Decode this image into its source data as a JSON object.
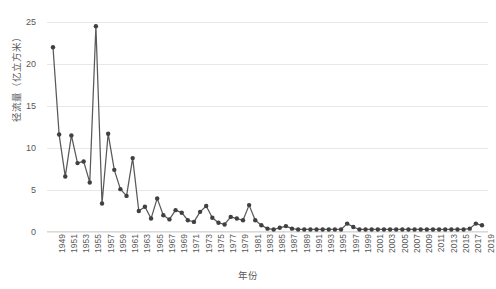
{
  "chart_data": {
    "type": "line",
    "title": "",
    "xlabel": "年份",
    "ylabel": "径流量（亿立方米）",
    "xlim": [
      1949,
      2019
    ],
    "ylim": [
      0,
      25
    ],
    "yticks": [
      0,
      5,
      10,
      15,
      20,
      25
    ],
    "xticks": [
      1949,
      1951,
      1953,
      1955,
      1957,
      1959,
      1961,
      1963,
      1965,
      1967,
      1969,
      1971,
      1973,
      1975,
      1977,
      1979,
      1981,
      1983,
      1985,
      1987,
      1989,
      1991,
      1993,
      1995,
      1997,
      1999,
      2001,
      2003,
      2005,
      2007,
      2009,
      2011,
      2013,
      2015,
      2017,
      2019
    ],
    "grid": true,
    "legend": false,
    "marker": "circle",
    "line_color": "#595959",
    "marker_color": "#404040",
    "grid_color": "#e8e8e8",
    "x": [
      1949,
      1950,
      1951,
      1952,
      1953,
      1954,
      1955,
      1956,
      1957,
      1958,
      1959,
      1960,
      1961,
      1962,
      1963,
      1964,
      1965,
      1966,
      1967,
      1968,
      1969,
      1970,
      1971,
      1972,
      1973,
      1974,
      1975,
      1976,
      1977,
      1978,
      1979,
      1980,
      1981,
      1982,
      1983,
      1984,
      1985,
      1986,
      1987,
      1988,
      1989,
      1990,
      1991,
      1992,
      1993,
      1994,
      1995,
      1996,
      1997,
      1998,
      1999,
      2000,
      2001,
      2002,
      2003,
      2004,
      2005,
      2006,
      2007,
      2008,
      2009,
      2010,
      2011,
      2012,
      2013,
      2014,
      2015,
      2016,
      2017,
      2018,
      2019
    ],
    "values": [
      22.0,
      11.6,
      6.6,
      11.5,
      8.2,
      8.4,
      5.9,
      24.5,
      3.4,
      11.7,
      7.4,
      5.1,
      4.3,
      8.8,
      2.5,
      3.0,
      1.6,
      4.0,
      2.0,
      1.5,
      2.6,
      2.3,
      1.4,
      1.2,
      2.4,
      3.1,
      1.7,
      1.1,
      0.9,
      1.8,
      1.6,
      1.4,
      3.2,
      1.4,
      0.8,
      0.4,
      0.3,
      0.5,
      0.7,
      0.4,
      0.3,
      0.3,
      0.3,
      0.3,
      0.3,
      0.3,
      0.3,
      0.3,
      1.0,
      0.6,
      0.3,
      0.3,
      0.3,
      0.3,
      0.3,
      0.3,
      0.3,
      0.3,
      0.3,
      0.3,
      0.3,
      0.3,
      0.3,
      0.3,
      0.3,
      0.3,
      0.3,
      0.3,
      0.4,
      1.0,
      0.8
    ],
    "series": [
      {
        "name": "径流量",
        "values": [
          22.0,
          11.6,
          6.6,
          11.5,
          8.2,
          8.4,
          5.9,
          24.5,
          3.4,
          11.7,
          7.4,
          5.1,
          4.3,
          8.8,
          2.5,
          3.0,
          1.6,
          4.0,
          2.0,
          1.5,
          2.6,
          2.3,
          1.4,
          1.2,
          2.4,
          3.1,
          1.7,
          1.1,
          0.9,
          1.8,
          1.6,
          1.4,
          3.2,
          1.4,
          0.8,
          0.4,
          0.3,
          0.5,
          0.7,
          0.4,
          0.3,
          0.3,
          0.3,
          0.3,
          0.3,
          0.3,
          0.3,
          0.3,
          1.0,
          0.6,
          0.3,
          0.3,
          0.3,
          0.3,
          0.3,
          0.3,
          0.3,
          0.3,
          0.3,
          0.3,
          0.3,
          0.3,
          0.3,
          0.3,
          0.3,
          0.3,
          0.3,
          0.3,
          0.4,
          1.0,
          0.8
        ]
      }
    ]
  }
}
